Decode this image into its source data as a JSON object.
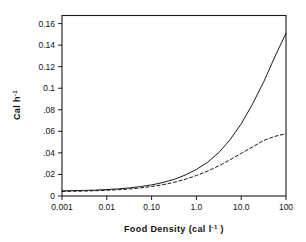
{
  "chart_data": {
    "type": "line",
    "title": "",
    "subtitle": "",
    "xlabel": "Food Density (cal l⁻¹ )",
    "ylabel": "Cal h⁻¹",
    "xscale": "log",
    "yscale": "linear",
    "xlim": [
      0.001,
      100
    ],
    "ylim": [
      0,
      0.1675
    ],
    "grid": false,
    "legend": "none",
    "xticks": [
      0.001,
      0.01,
      0.1,
      1,
      10,
      100
    ],
    "xtick_labels": [
      "0.001",
      "0.01",
      "0.10",
      "1.0",
      "10.0",
      "100"
    ],
    "yticks": [
      0,
      0.02,
      0.04,
      0.06,
      0.08,
      0.1,
      0.12,
      0.14,
      0.16
    ],
    "ytick_labels": [
      "0",
      ".02",
      ".04",
      ".06",
      ".08",
      "0.1",
      "0.12",
      "0.14",
      "0.16"
    ],
    "series": [
      {
        "name": "solid-curve",
        "style": "solid",
        "color": "#1a1a1a",
        "x": [
          0.001,
          0.0018,
          0.0032,
          0.0056,
          0.01,
          0.018,
          0.032,
          0.056,
          0.1,
          0.18,
          0.32,
          0.56,
          1.0,
          1.8,
          3.2,
          5.6,
          10.0,
          18.0,
          32.0,
          56.0,
          100.0
        ],
        "y": [
          0.0048,
          0.005,
          0.0052,
          0.0055,
          0.006,
          0.0066,
          0.0075,
          0.0087,
          0.0103,
          0.0125,
          0.0155,
          0.0194,
          0.0246,
          0.0315,
          0.0405,
          0.0521,
          0.0669,
          0.0855,
          0.1062,
          0.129,
          0.151
        ]
      },
      {
        "name": "dashed-curve",
        "style": "dashed",
        "color": "#1a1a1a",
        "x": [
          0.001,
          0.0018,
          0.0032,
          0.0056,
          0.01,
          0.018,
          0.032,
          0.056,
          0.1,
          0.18,
          0.32,
          0.56,
          1.0,
          1.8,
          3.2,
          5.6,
          10.0,
          18.0,
          32.0,
          56.0,
          100.0
        ],
        "y": [
          0.0042,
          0.0044,
          0.0046,
          0.0049,
          0.0053,
          0.0058,
          0.0065,
          0.0075,
          0.0088,
          0.0105,
          0.0127,
          0.0155,
          0.019,
          0.0232,
          0.0281,
          0.0336,
          0.0395,
          0.0456,
          0.0516,
          0.0553,
          0.0578
        ]
      }
    ]
  },
  "axes": {
    "x_title": "Food Density (cal l⁻¹ )",
    "x_title_main": "Food Density (cal l",
    "x_title_sup": "-1",
    "x_title_tail": " )",
    "y_title_main": "Cal  h",
    "y_title_sup": "-1"
  },
  "colors": {
    "frame": "#1a1a1a",
    "background": "#ffffff",
    "ink": "#111111"
  }
}
